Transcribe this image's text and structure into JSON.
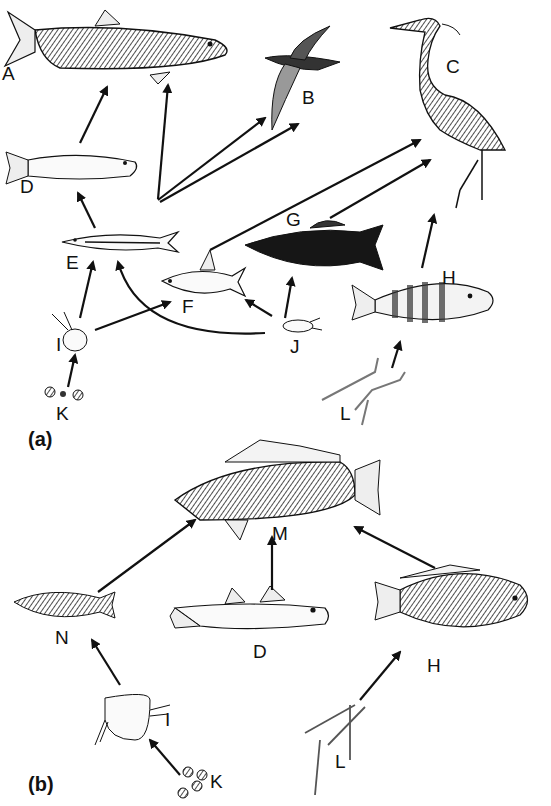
{
  "panels": [
    {
      "id": "a",
      "label": "(a)"
    },
    {
      "id": "b",
      "label": "(b)"
    }
  ],
  "nodes_a": {
    "A": "A",
    "B": "B",
    "C": "C",
    "D": "D",
    "E": "E",
    "F": "F",
    "G": "G",
    "H": "H",
    "I": "I",
    "J": "J",
    "K": "K",
    "L": "L"
  },
  "nodes_b": {
    "M": "M",
    "N": "N",
    "D": "D",
    "H": "H",
    "I": "I",
    "K": "K",
    "L": "L"
  },
  "edges_a": [
    [
      "D",
      "A"
    ],
    [
      "E",
      "A"
    ],
    [
      "E",
      "B"
    ],
    [
      "E",
      "C"
    ],
    [
      "E",
      "D"
    ],
    [
      "F",
      "C"
    ],
    [
      "G",
      "C"
    ],
    [
      "H",
      "C"
    ],
    [
      "I",
      "E"
    ],
    [
      "I",
      "F"
    ],
    [
      "J",
      "E"
    ],
    [
      "J",
      "F"
    ],
    [
      "J",
      "G"
    ],
    [
      "K",
      "I"
    ],
    [
      "L",
      "H"
    ]
  ],
  "edges_b": [
    [
      "N",
      "M"
    ],
    [
      "D",
      "M"
    ],
    [
      "H",
      "M"
    ],
    [
      "I",
      "N"
    ],
    [
      "K",
      "I"
    ],
    [
      "L",
      "H"
    ]
  ],
  "colors": {
    "ink": "#111111",
    "light": "#888888",
    "dark": "#1a1a1a"
  }
}
